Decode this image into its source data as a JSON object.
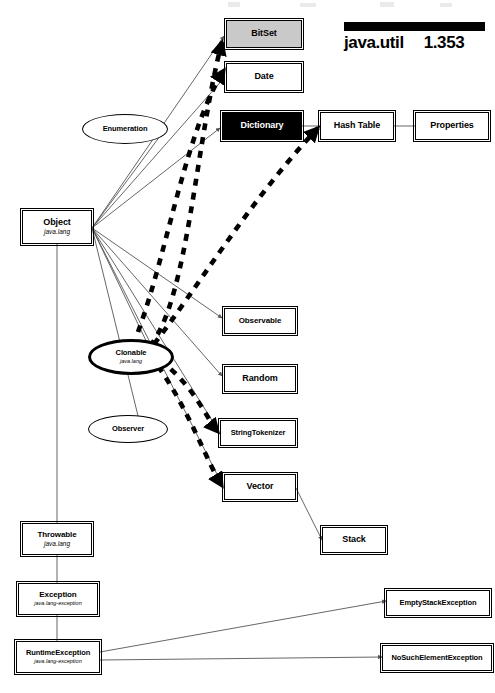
{
  "header": {
    "package": "java.util",
    "page": "1.353"
  },
  "legend_note": "",
  "nodes": [
    {
      "id": "bitset",
      "name": "BitSet",
      "subtitle": "",
      "shape": "box",
      "fill": "gray",
      "x": 226,
      "y": 20,
      "w": 76,
      "h": 28
    },
    {
      "id": "date",
      "name": "Date",
      "subtitle": "",
      "shape": "box",
      "fill": "white",
      "x": 226,
      "y": 63,
      "w": 76,
      "h": 28
    },
    {
      "id": "dictionary",
      "name": "Dictionary",
      "subtitle": "",
      "shape": "box",
      "fill": "black",
      "x": 222,
      "y": 112,
      "w": 80,
      "h": 28
    },
    {
      "id": "hashtable",
      "name": "Hash Table",
      "subtitle": "",
      "shape": "box",
      "fill": "white",
      "x": 320,
      "y": 112,
      "w": 74,
      "h": 28
    },
    {
      "id": "properties",
      "name": "Properties",
      "subtitle": "",
      "shape": "box",
      "fill": "white",
      "x": 415,
      "y": 112,
      "w": 74,
      "h": 28
    },
    {
      "id": "object",
      "name": "Object",
      "subtitle": "java.lang",
      "shape": "box",
      "fill": "white",
      "x": 22,
      "y": 210,
      "w": 70,
      "h": 34
    },
    {
      "id": "observable",
      "name": "Observable",
      "subtitle": "",
      "shape": "box",
      "fill": "white",
      "x": 224,
      "y": 308,
      "w": 72,
      "h": 26
    },
    {
      "id": "random",
      "name": "Random",
      "subtitle": "",
      "shape": "box",
      "fill": "white",
      "x": 224,
      "y": 366,
      "w": 72,
      "h": 26
    },
    {
      "id": "stringtokenizer",
      "name": "StringTokenizer",
      "subtitle": "",
      "shape": "box",
      "fill": "white",
      "x": 220,
      "y": 420,
      "w": 76,
      "h": 26
    },
    {
      "id": "vector",
      "name": "Vector",
      "subtitle": "",
      "shape": "box",
      "fill": "white",
      "x": 224,
      "y": 474,
      "w": 72,
      "h": 26
    },
    {
      "id": "stack",
      "name": "Stack",
      "subtitle": "",
      "shape": "box",
      "fill": "white",
      "x": 322,
      "y": 527,
      "w": 64,
      "h": 26
    },
    {
      "id": "throwable",
      "name": "Throwable",
      "subtitle": "java.lang",
      "shape": "box",
      "fill": "white",
      "x": 22,
      "y": 523,
      "w": 70,
      "h": 32
    },
    {
      "id": "exception",
      "name": "Exception",
      "subtitle": "java.lang-exception",
      "shape": "box",
      "fill": "white",
      "x": 18,
      "y": 583,
      "w": 80,
      "h": 32
    },
    {
      "id": "runtimeexception",
      "name": "RuntimeException",
      "subtitle": "java.lang-exception",
      "shape": "box",
      "fill": "white",
      "x": 16,
      "y": 641,
      "w": 84,
      "h": 32
    },
    {
      "id": "emptystack",
      "name": "EmptyStackException",
      "subtitle": "",
      "shape": "box",
      "fill": "white",
      "x": 386,
      "y": 590,
      "w": 104,
      "h": 26
    },
    {
      "id": "nosuchelement",
      "name": "NoSuchElementException",
      "subtitle": "",
      "shape": "box",
      "fill": "white",
      "x": 382,
      "y": 645,
      "w": 110,
      "h": 26
    },
    {
      "id": "enumeration",
      "name": "Enumeration",
      "subtitle": "",
      "shape": "ellipse",
      "fill": "white",
      "x": 82,
      "y": 114,
      "w": 86,
      "h": 30
    },
    {
      "id": "clonable",
      "name": "Clonable",
      "subtitle": "java.lang",
      "shape": "ellipse-thick",
      "fill": "white",
      "x": 88,
      "y": 339,
      "w": 86,
      "h": 36
    },
    {
      "id": "observer",
      "name": "Observer",
      "subtitle": "",
      "shape": "ellipse",
      "fill": "white",
      "x": 88,
      "y": 415,
      "w": 80,
      "h": 28
    }
  ],
  "edges": {
    "inheritance": [
      {
        "from": "object",
        "to": "bitset"
      },
      {
        "from": "object",
        "to": "date"
      },
      {
        "from": "object",
        "to": "dictionary"
      },
      {
        "from": "object",
        "to": "enumeration"
      },
      {
        "from": "object",
        "to": "observable"
      },
      {
        "from": "object",
        "to": "random"
      },
      {
        "from": "object",
        "to": "stringtokenizer"
      },
      {
        "from": "object",
        "to": "vector"
      },
      {
        "from": "object",
        "to": "clonable"
      },
      {
        "from": "object",
        "to": "throwable"
      },
      {
        "from": "dictionary",
        "to": "hashtable"
      },
      {
        "from": "hashtable",
        "to": "properties"
      },
      {
        "from": "vector",
        "to": "stack"
      },
      {
        "from": "throwable",
        "to": "exception"
      },
      {
        "from": "exception",
        "to": "runtimeexception"
      },
      {
        "from": "runtimeexception",
        "to": "emptystack"
      },
      {
        "from": "runtimeexception",
        "to": "nosuchelement"
      }
    ],
    "implements": [
      {
        "from": "clonable",
        "to": "bitset"
      },
      {
        "from": "clonable",
        "to": "date"
      },
      {
        "from": "clonable",
        "to": "hashtable"
      },
      {
        "from": "clonable",
        "to": "stringtokenizer"
      },
      {
        "from": "clonable",
        "to": "vector"
      }
    ]
  },
  "style": {
    "line_color": "#55555a",
    "dashed_color": "#000000",
    "gray_fill": "#c9c9c9",
    "black_fill": "#000000"
  }
}
